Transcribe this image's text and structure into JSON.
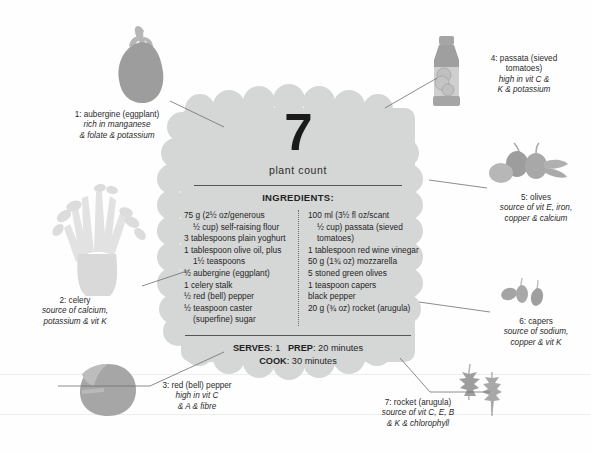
{
  "badge": {
    "number": "7",
    "label": "plant count",
    "ingredients_heading": "INGREDIENTS:",
    "ingredients_left": [
      {
        "text": "75 g (2½ oz/generous",
        "indent": false
      },
      {
        "text": "½ cup) self-raising flour",
        "indent": true
      },
      {
        "text": "3 tablespoons plain yoghurt",
        "indent": false
      },
      {
        "text": "1 tablespoon olive oil, plus",
        "indent": false
      },
      {
        "text": "1½ teaspoons",
        "indent": true
      },
      {
        "text": "½ aubergine (eggplant)",
        "indent": false
      },
      {
        "text": "1 celery stalk",
        "indent": false
      },
      {
        "text": "½ red (bell) pepper",
        "indent": false
      },
      {
        "text": "½ teaspoon caster",
        "indent": false
      },
      {
        "text": "(superfine) sugar",
        "indent": true
      }
    ],
    "ingredients_right": [
      {
        "text": "100 ml (3½ fl oz/scant",
        "indent": false
      },
      {
        "text": "½ cup) passata (sieved",
        "indent": true
      },
      {
        "text": "tomatoes)",
        "indent": true
      },
      {
        "text": "1 tablespoon red wine vinegar",
        "indent": false
      },
      {
        "text": "50 g (1¾ oz) mozzarella",
        "indent": false
      },
      {
        "text": "5 stoned green olives",
        "indent": false
      },
      {
        "text": "1 teaspoon capers",
        "indent": false
      },
      {
        "text": "black pepper",
        "indent": false
      },
      {
        "text": "20 g (¾ oz) rocket (arugula)",
        "indent": false
      }
    ],
    "serves_label": "SERVES",
    "serves_value": "1",
    "prep_label": "PREP",
    "prep_value": "20 minutes",
    "cook_label": "COOK",
    "cook_value": "30 minutes"
  },
  "callouts": [
    {
      "id": "aubergine",
      "title": "1: aubergine (eggplant)",
      "nutrients_line1": "rich in manganese",
      "nutrients_line2": "& folate & potassium"
    },
    {
      "id": "celery",
      "title": "2: celery",
      "nutrients_line1": "source of calcium,",
      "nutrients_line2": "potassium & vit K"
    },
    {
      "id": "red-pepper",
      "title": "3: red (bell) pepper",
      "nutrients_line1": "high in vit C",
      "nutrients_line2": "& A & fibre"
    },
    {
      "id": "passata",
      "title": "4: passata (sieved",
      "title_line2": "tomatoes)",
      "nutrients_line1": "high in vit C &",
      "nutrients_line2": "K & potassium"
    },
    {
      "id": "olives",
      "title": "5: olives",
      "nutrients_line1": "source of vit E, iron,",
      "nutrients_line2": "copper & calcium"
    },
    {
      "id": "capers",
      "title": "6: capers",
      "nutrients_line1": "source of sodium,",
      "nutrients_line2": "copper & vit K"
    },
    {
      "id": "rocket",
      "title": "7: rocket (arugula)",
      "nutrients_line1": "source of vit C, E, B",
      "nutrients_line2": "& K & chlorophyll"
    }
  ],
  "colors": {
    "badge": "#d5d6d6",
    "art_dark": "#9a9a9a",
    "art_mid": "#b5b5b5",
    "art_light": "#d7d7d7",
    "art_pale": "#e8e8e8",
    "text": "#231f20",
    "leader": "#6e6e6e"
  }
}
